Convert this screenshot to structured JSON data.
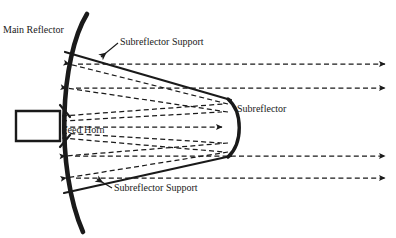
{
  "figure": {
    "type": "antenna-optics-diagram",
    "title_visible": false,
    "background_color": "#ffffff",
    "ink_color": "#1a1a1a",
    "width": 396,
    "height": 238
  },
  "labels": {
    "main_reflector": "Main Reflector",
    "subreflector": "Subreflector",
    "feed_horn": "Feed Horn",
    "subreflector_support_top": "Subreflector Support",
    "subreflector_support_bottom": "Subreflector Support"
  },
  "components": {
    "main_reflector": {
      "name": "Main Reflector",
      "shape": "concave-arc",
      "orientation": "opens-right",
      "line_weight": "thick"
    },
    "subreflector": {
      "name": "Subreflector",
      "shape": "convex-arc",
      "orientation": "bulges-right",
      "line_weight": "medium"
    },
    "feed_horn": {
      "name": "Feed Horn",
      "shape": "rectangle",
      "line_weight": "medium"
    },
    "supports": [
      {
        "name": "upper support strut",
        "style": "solid"
      },
      {
        "name": "lower support strut",
        "style": "solid"
      }
    ]
  },
  "rays": {
    "style": "dashed",
    "arrowhead": "solid-triangle",
    "groups": [
      {
        "name": "outgoing-collimated-upper",
        "count": 2,
        "direction": "right"
      },
      {
        "name": "outgoing-collimated-lower",
        "count": 2,
        "direction": "right"
      },
      {
        "name": "reflector-to-subreflector-upper",
        "count": 2,
        "direction": "left"
      },
      {
        "name": "reflector-to-subreflector-lower",
        "count": 2,
        "direction": "left"
      },
      {
        "name": "feed-axis-ray",
        "count": 1,
        "direction": "right"
      }
    ]
  }
}
